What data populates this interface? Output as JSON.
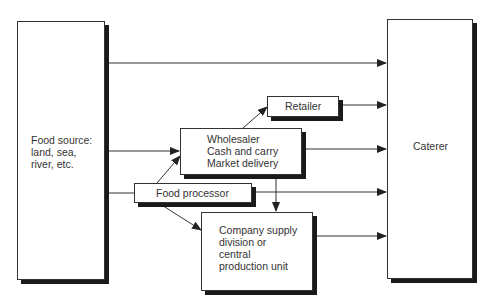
{
  "diagram": {
    "type": "flowchart",
    "nodes": {
      "food_source": {
        "line1": "Food source:",
        "line2": "land, sea,",
        "line3": "river, etc."
      },
      "caterer": {
        "label": "Caterer"
      },
      "retailer": {
        "label": "Retailer"
      },
      "wholesaler": {
        "line1": "Wholesaler",
        "line2": "Cash and carry",
        "line3": "Market delivery"
      },
      "food_processor": {
        "label": "Food processor"
      },
      "company_supply": {
        "line1": "Company supply",
        "line2": "division or",
        "line3": "central",
        "line4": "production unit"
      }
    },
    "edges": [
      {
        "from": "Food source",
        "to": "Caterer"
      },
      {
        "from": "Food source",
        "to": "Wholesaler"
      },
      {
        "from": "Food source",
        "to": "Food processor"
      },
      {
        "from": "Food processor",
        "to": "Wholesaler"
      },
      {
        "from": "Food processor",
        "to": "Company supply division or central production unit"
      },
      {
        "from": "Food processor",
        "to": "Caterer"
      },
      {
        "from": "Wholesaler",
        "to": "Retailer"
      },
      {
        "from": "Wholesaler",
        "to": "Caterer"
      },
      {
        "from": "Wholesaler",
        "to": "Company supply division or central production unit"
      },
      {
        "from": "Retailer",
        "to": "Caterer"
      },
      {
        "from": "Company supply division or central production unit",
        "to": "Caterer"
      }
    ],
    "colors": {
      "line": "#333333",
      "shadow": "#1a1a1a",
      "background": "#ffffff"
    }
  }
}
